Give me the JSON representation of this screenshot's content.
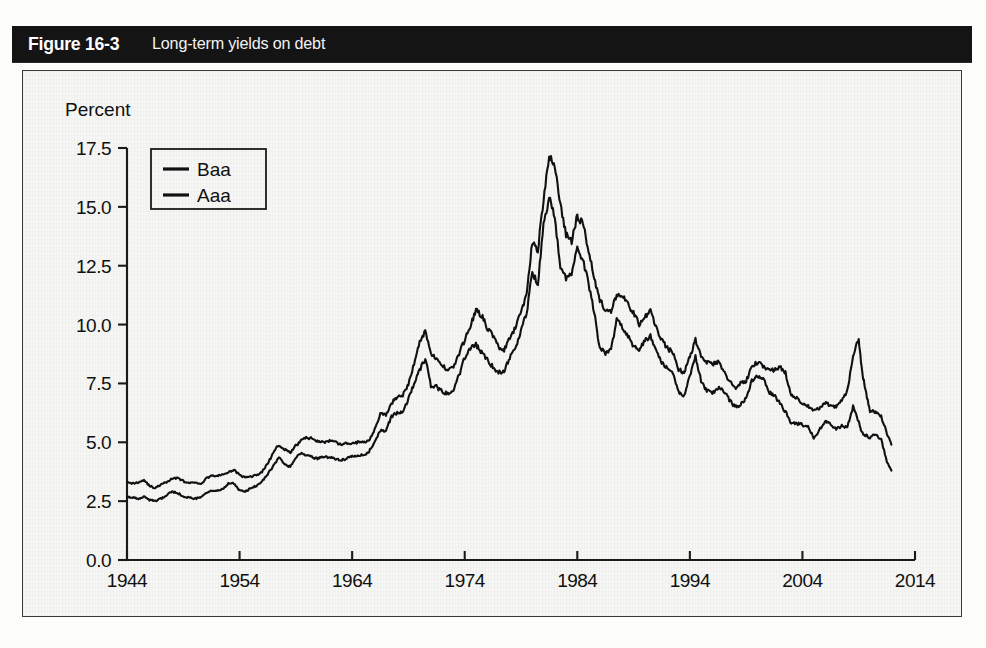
{
  "figure": {
    "number_label": "Figure 16-3",
    "caption": "Long-term yields on debt"
  },
  "axes": {
    "y_axis_title": "Percent",
    "y_ticks": [
      "0.0",
      "2.5",
      "5.0",
      "7.5",
      "10.0",
      "12.5",
      "15.0",
      "17.5"
    ],
    "x_ticks": [
      "1944",
      "1954",
      "1964",
      "1974",
      "1984",
      "1994",
      "2004",
      "2014"
    ]
  },
  "legend": {
    "entries": [
      {
        "label": "Baa",
        "color": "#111111"
      },
      {
        "label": "Aaa",
        "color": "#111111"
      }
    ]
  },
  "chart_data": {
    "type": "line",
    "title": "Long-term yields on debt",
    "xlabel": "",
    "ylabel": "Percent",
    "xlim": [
      1944,
      2014
    ],
    "ylim": [
      0.0,
      17.5
    ],
    "grid": false,
    "legend_position": "upper-left-inside",
    "x_tick_values": [
      1944,
      1954,
      1964,
      1974,
      1984,
      1994,
      2004,
      2014
    ],
    "y_tick_values": [
      0.0,
      2.5,
      5.0,
      7.5,
      10.0,
      12.5,
      15.0,
      17.5
    ],
    "x": [
      1944.0,
      1944.5,
      1945.0,
      1945.5,
      1946.0,
      1946.5,
      1947.0,
      1947.5,
      1948.0,
      1948.5,
      1949.0,
      1949.5,
      1950.0,
      1950.5,
      1951.0,
      1951.5,
      1952.0,
      1952.5,
      1953.0,
      1953.5,
      1954.0,
      1954.5,
      1955.0,
      1955.5,
      1956.0,
      1956.5,
      1957.0,
      1957.5,
      1958.0,
      1958.5,
      1959.0,
      1959.5,
      1960.0,
      1960.5,
      1961.0,
      1961.5,
      1962.0,
      1962.5,
      1963.0,
      1963.5,
      1964.0,
      1964.5,
      1965.0,
      1965.5,
      1966.0,
      1966.5,
      1967.0,
      1967.5,
      1968.0,
      1968.5,
      1969.0,
      1969.5,
      1970.0,
      1970.5,
      1971.0,
      1971.5,
      1972.0,
      1972.5,
      1973.0,
      1973.5,
      1974.0,
      1974.5,
      1975.0,
      1975.5,
      1976.0,
      1976.5,
      1977.0,
      1977.5,
      1978.0,
      1978.5,
      1979.0,
      1979.5,
      1980.0,
      1980.5,
      1981.0,
      1981.5,
      1982.0,
      1982.5,
      1983.0,
      1983.5,
      1984.0,
      1984.5,
      1985.0,
      1985.5,
      1986.0,
      1986.5,
      1987.0,
      1987.5,
      1988.0,
      1988.5,
      1989.0,
      1989.5,
      1990.0,
      1990.5,
      1991.0,
      1991.5,
      1992.0,
      1992.5,
      1993.0,
      1993.5,
      1994.0,
      1994.5,
      1995.0,
      1995.5,
      1996.0,
      1996.5,
      1997.0,
      1997.5,
      1998.0,
      1998.5,
      1999.0,
      1999.5,
      2000.0,
      2000.5,
      2001.0,
      2001.5,
      2002.0,
      2002.5,
      2003.0,
      2003.5,
      2004.0,
      2004.5,
      2005.0,
      2005.5,
      2006.0,
      2006.5,
      2007.0,
      2007.5,
      2008.0,
      2008.5,
      2009.0,
      2009.3,
      2009.6,
      2010.0,
      2010.5,
      2011.0,
      2011.5,
      2011.9
    ],
    "series": [
      {
        "name": "Baa",
        "color": "#111111",
        "values": [
          3.35,
          3.25,
          3.3,
          3.4,
          3.15,
          3.05,
          3.2,
          3.3,
          3.45,
          3.5,
          3.35,
          3.25,
          3.3,
          3.2,
          3.45,
          3.6,
          3.55,
          3.65,
          3.7,
          3.85,
          3.6,
          3.5,
          3.55,
          3.6,
          3.75,
          4.1,
          4.55,
          4.9,
          4.7,
          4.55,
          4.85,
          5.1,
          5.2,
          5.15,
          5.05,
          5.0,
          5.05,
          5.0,
          4.9,
          4.95,
          4.95,
          5.0,
          5.0,
          5.1,
          5.55,
          6.2,
          6.15,
          6.65,
          6.95,
          7.0,
          7.45,
          8.35,
          9.25,
          9.75,
          8.8,
          8.5,
          8.25,
          8.1,
          8.2,
          8.75,
          9.35,
          9.95,
          10.6,
          10.4,
          9.85,
          9.55,
          9.05,
          8.9,
          9.4,
          9.85,
          10.55,
          11.3,
          13.5,
          13.2,
          15.3,
          17.1,
          16.8,
          15.1,
          13.8,
          13.55,
          14.6,
          14.3,
          13.2,
          12.0,
          11.05,
          10.6,
          10.5,
          11.3,
          11.2,
          10.85,
          10.5,
          10.0,
          10.3,
          10.6,
          9.9,
          9.35,
          9.0,
          8.8,
          8.1,
          7.95,
          8.65,
          9.35,
          8.7,
          8.4,
          8.3,
          8.4,
          8.05,
          7.6,
          7.3,
          7.5,
          7.6,
          8.2,
          8.4,
          8.25,
          8.1,
          8.05,
          8.2,
          7.95,
          7.0,
          6.85,
          6.65,
          6.55,
          6.3,
          6.45,
          6.7,
          6.55,
          6.5,
          6.8,
          7.2,
          8.7,
          9.4,
          8.0,
          7.2,
          6.35,
          6.3,
          6.1,
          5.4,
          4.9
        ]
      },
      {
        "name": "Aaa",
        "color": "#111111",
        "values": [
          2.7,
          2.65,
          2.6,
          2.7,
          2.55,
          2.5,
          2.6,
          2.75,
          2.9,
          2.85,
          2.7,
          2.65,
          2.6,
          2.65,
          2.85,
          2.95,
          2.95,
          3.0,
          3.25,
          3.25,
          2.95,
          2.9,
          3.05,
          3.15,
          3.35,
          3.65,
          4.0,
          4.35,
          4.05,
          3.95,
          4.35,
          4.55,
          4.45,
          4.35,
          4.3,
          4.4,
          4.35,
          4.3,
          4.25,
          4.3,
          4.4,
          4.45,
          4.45,
          4.6,
          5.05,
          5.5,
          5.5,
          6.1,
          6.25,
          6.3,
          6.85,
          7.5,
          8.05,
          8.55,
          7.4,
          7.35,
          7.15,
          7.05,
          7.25,
          7.85,
          8.6,
          9.0,
          9.15,
          8.8,
          8.5,
          8.2,
          7.95,
          8.05,
          8.6,
          9.0,
          9.7,
          10.5,
          12.2,
          11.75,
          14.2,
          15.4,
          14.5,
          12.5,
          12.0,
          12.2,
          13.2,
          12.8,
          11.7,
          10.5,
          9.0,
          8.8,
          8.9,
          10.2,
          9.9,
          9.5,
          9.1,
          8.9,
          9.3,
          9.5,
          8.85,
          8.35,
          8.2,
          7.9,
          7.15,
          6.95,
          7.8,
          8.65,
          7.6,
          7.2,
          7.1,
          7.3,
          7.2,
          6.8,
          6.5,
          6.6,
          6.85,
          7.6,
          7.85,
          7.75,
          7.15,
          7.0,
          6.65,
          6.3,
          5.8,
          5.8,
          5.75,
          5.65,
          5.2,
          5.5,
          5.9,
          5.8,
          5.55,
          5.7,
          5.65,
          6.5,
          5.85,
          5.4,
          5.3,
          5.2,
          5.35,
          5.1,
          4.2,
          3.8
        ]
      }
    ]
  }
}
